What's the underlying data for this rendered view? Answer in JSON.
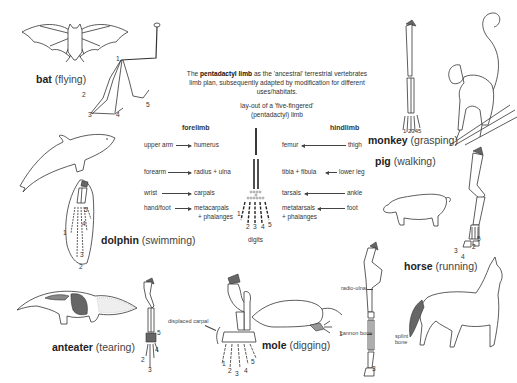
{
  "intro": {
    "prefix": "The ",
    "bold": "pentadactyl limb",
    "suffix": " as the 'ancestral' terrestrial vertebrates limb plan, subsequently adapted by modification for different uses/habitats."
  },
  "layout_caption": "lay-out of a 'five-fingered' (pentadactyl) limb",
  "forelimb": {
    "heading": "forelimb",
    "rows": [
      {
        "common": "upper arm",
        "bone": "humerus"
      },
      {
        "common": "forearm",
        "bone": "radius + ulna"
      },
      {
        "common": "wrist",
        "bone": "carpals"
      },
      {
        "common": "hand/foot",
        "bone": "metacarpals",
        "bone2": "+ phalanges"
      }
    ]
  },
  "hindlimb": {
    "heading": "hindlimb",
    "rows": [
      {
        "bone": "femur",
        "common": "thigh"
      },
      {
        "bone": "tibia + fibula",
        "common": "lower leg"
      },
      {
        "bone": "tarsals",
        "common": "ankle"
      },
      {
        "bone": "metatarsals",
        "bone2": "+ phalanges",
        "common": "foot"
      }
    ]
  },
  "digits": {
    "label": "digits",
    "numbers": [
      "1",
      "2",
      "3",
      "4",
      "5"
    ]
  },
  "animals": [
    {
      "name": "bat",
      "use": "(flying)",
      "digits": [
        "1",
        "2",
        "3",
        "4",
        "5"
      ]
    },
    {
      "name": "monkey",
      "use": "(grasping)",
      "digits": [
        "1",
        "2",
        "3",
        "4",
        "5"
      ]
    },
    {
      "name": "pig",
      "use": "(walking)",
      "digits": [
        "2",
        "3",
        "4",
        "5"
      ]
    },
    {
      "name": "dolphin",
      "use": "(swimming)",
      "digits": [
        "1",
        "2",
        "3",
        "4",
        "5"
      ]
    },
    {
      "name": "horse",
      "use": "(running)",
      "digits": [
        "3"
      ]
    },
    {
      "name": "anteater",
      "use": "(tearing)",
      "digits": [
        "2",
        "3",
        "4",
        "5"
      ]
    },
    {
      "name": "mole",
      "use": "(digging)",
      "digits": [
        "1",
        "2",
        "3",
        "4",
        "5"
      ]
    }
  ],
  "annotations": {
    "displaced_carpal": "displaced carpal",
    "radio_ulna": "radio-ulna",
    "cannon_bone": "cannon bone",
    "splint_bone_1": "splint",
    "splint_bone_2": "bone"
  }
}
